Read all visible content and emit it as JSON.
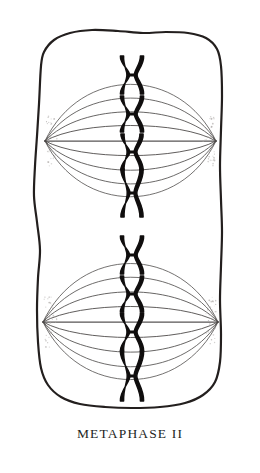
{
  "figure": {
    "caption": "METAPHASE II",
    "background_color": "#ffffff",
    "ink_color": "#231f1e",
    "chromosome_color": "#100e0e",
    "spindle_color": "#4a4746",
    "pole_stipple_color": "#a9a5a3"
  },
  "cell": {
    "name": "cell-membrane",
    "fill_color": "#ffffff",
    "stroke_color": "#231f1e",
    "stroke_width": 2.2,
    "outline_points": [
      [
        41,
        66
      ],
      [
        44,
        52
      ],
      [
        54,
        40
      ],
      [
        70,
        33
      ],
      [
        92,
        30
      ],
      [
        118,
        31
      ],
      [
        143,
        33
      ],
      [
        166,
        32
      ],
      [
        188,
        33
      ],
      [
        206,
        38
      ],
      [
        217,
        49
      ],
      [
        221,
        66
      ],
      [
        222,
        96
      ],
      [
        221,
        130
      ],
      [
        220,
        166
      ],
      [
        221,
        200
      ],
      [
        222,
        232
      ],
      [
        221,
        266
      ],
      [
        220,
        300
      ],
      [
        221,
        334
      ],
      [
        220,
        362
      ],
      [
        215,
        382
      ],
      [
        203,
        395
      ],
      [
        185,
        403
      ],
      [
        160,
        407
      ],
      [
        132,
        408
      ],
      [
        105,
        407
      ],
      [
        80,
        404
      ],
      [
        61,
        397
      ],
      [
        48,
        385
      ],
      [
        41,
        368
      ],
      [
        38,
        342
      ],
      [
        37,
        310
      ],
      [
        38,
        278
      ],
      [
        40,
        250
      ],
      [
        37,
        222
      ],
      [
        34,
        196
      ],
      [
        35,
        166
      ],
      [
        37,
        136
      ],
      [
        39,
        104
      ]
    ]
  },
  "spindles": [
    {
      "name": "spindle-top",
      "center_x": 130,
      "center_y": 141,
      "pole_left_x": 45,
      "pole_right_x": 216,
      "fiber_count": 9,
      "max_bulge": 66,
      "fiber_offsets": [
        -62,
        -47,
        -32,
        -17,
        0,
        16,
        32,
        47,
        61
      ]
    },
    {
      "name": "spindle-bottom",
      "center_x": 130,
      "center_y": 322,
      "pole_left_x": 43,
      "pole_right_x": 218,
      "fiber_count": 9,
      "max_bulge": 68,
      "fiber_offsets": [
        -64,
        -49,
        -33,
        -17,
        0,
        17,
        33,
        49,
        63
      ]
    }
  ],
  "chromosomes": {
    "plate_x": 132,
    "count_total": 8,
    "count_per_cell": 4,
    "groups": [
      {
        "name": "chromosome-group-top",
        "items": [
          {
            "name": "chromosome-top-1",
            "center_y": 75,
            "height": 38,
            "width": 20,
            "waist": 5.0
          },
          {
            "name": "chromosome-top-2",
            "center_y": 114,
            "height": 36,
            "width": 20,
            "waist": 5.0
          },
          {
            "name": "chromosome-top-3",
            "center_y": 152,
            "height": 36,
            "width": 19,
            "waist": 4.6
          },
          {
            "name": "chromosome-top-4",
            "center_y": 193,
            "height": 48,
            "width": 19,
            "waist": 4.4
          }
        ]
      },
      {
        "name": "chromosome-group-bottom",
        "items": [
          {
            "name": "chromosome-bottom-1",
            "center_y": 255,
            "height": 38,
            "width": 20,
            "waist": 5.0
          },
          {
            "name": "chromosome-bottom-2",
            "center_y": 294,
            "height": 36,
            "width": 20,
            "waist": 4.8
          },
          {
            "name": "chromosome-bottom-3",
            "center_y": 332,
            "height": 38,
            "width": 20,
            "waist": 4.8
          },
          {
            "name": "chromosome-bottom-4",
            "center_y": 376,
            "height": 50,
            "width": 20,
            "waist": 4.4
          }
        ]
      }
    ]
  }
}
